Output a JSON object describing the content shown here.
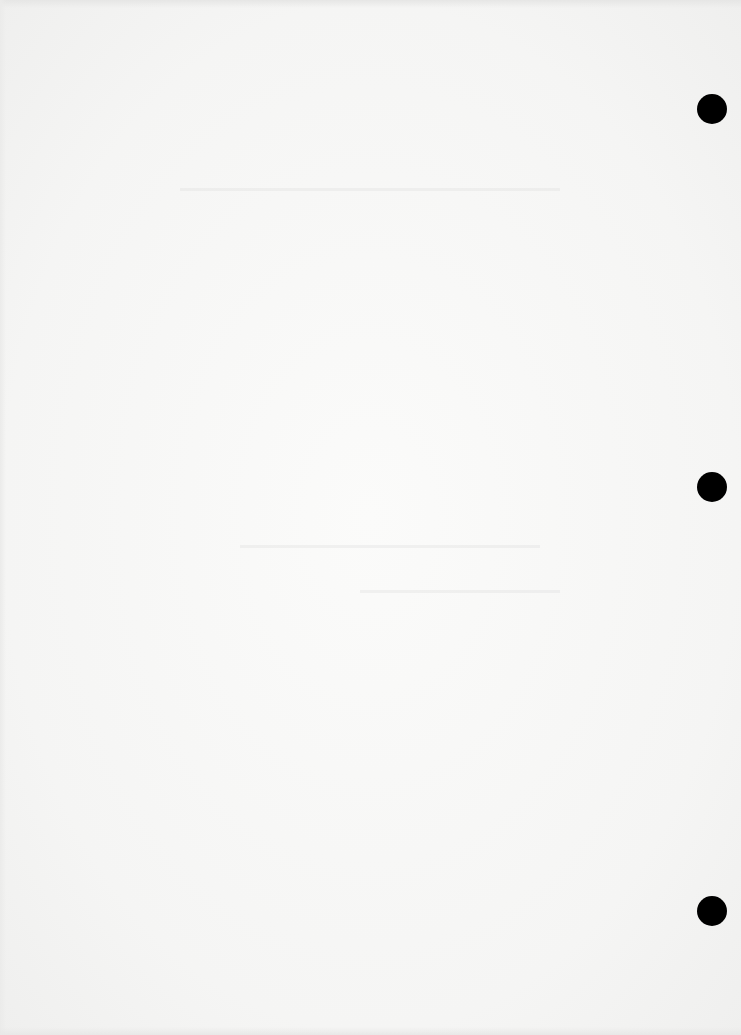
{
  "document": {
    "type": "scanned blank page",
    "background_color": "#f7f7f6",
    "hole_punches": [
      {
        "x": 697,
        "y": 94,
        "diameter": 30
      },
      {
        "x": 697,
        "y": 472,
        "diameter": 30
      },
      {
        "x": 697,
        "y": 896,
        "diameter": 30
      }
    ],
    "hole_color": "#000000",
    "text": ""
  }
}
